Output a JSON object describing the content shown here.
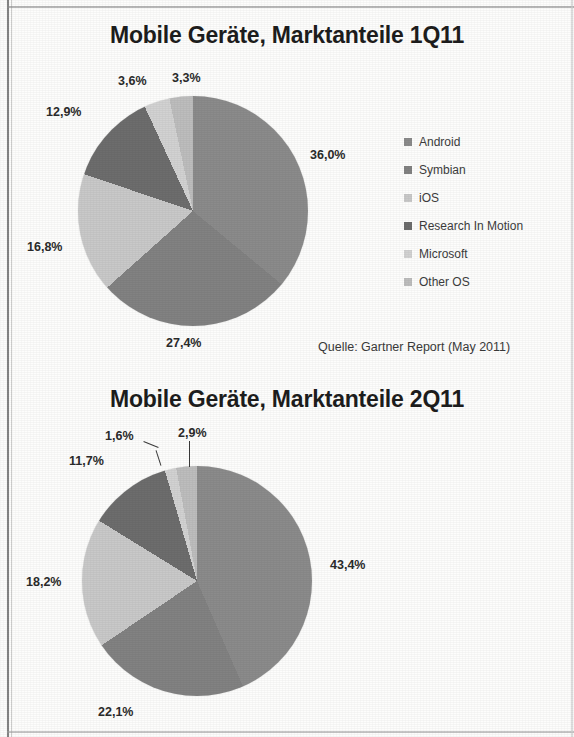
{
  "document": {
    "kind": "scanned-slide",
    "background_color": "#fdfdfc"
  },
  "palette": {
    "android": "#8b8b8b",
    "symbian": "#828282",
    "ios": "#c9c9c9",
    "rim": "#6d6d6d",
    "microsoft": "#d2d2d2",
    "other_os": "#bdbdbd",
    "text": "#1d1d1d",
    "label": "#2b2b2b"
  },
  "charts": [
    {
      "id": "chart-1q11",
      "title": "Mobile Geräte, Marktanteile 1Q11",
      "source": "Quelle: Gartner Report (May 2011)",
      "legend": [
        {
          "label": "Android",
          "color": "#8b8b8b"
        },
        {
          "label": "Symbian",
          "color": "#828282"
        },
        {
          "label": "iOS",
          "color": "#c9c9c9"
        },
        {
          "label": "Research In Motion",
          "color": "#6d6d6d"
        },
        {
          "label": "Microsoft",
          "color": "#d2d2d2"
        },
        {
          "label": "Other OS",
          "color": "#bdbdbd"
        }
      ],
      "labels": {
        "android": "36,0%",
        "symbian": "27,4%",
        "ios": "16,8%",
        "rim": "12,9%",
        "microsoft": "3,6%",
        "other_os": "3,3%"
      }
    },
    {
      "id": "chart-2q11",
      "title": "Mobile Geräte, Marktanteile 2Q11",
      "source": "Quelle: Gartner Report (August 2011)",
      "legend": [
        {
          "label": "Android",
          "color": "#8b8b8b"
        },
        {
          "label": "Symbian",
          "color": "#828282"
        },
        {
          "label": "iOS",
          "color": "#c9c9c9"
        },
        {
          "label": "Research In Motion",
          "color": "#6d6d6d"
        },
        {
          "label": "Microsoft",
          "color": "#d2d2d2"
        },
        {
          "label": "Other OS",
          "color": "#bdbdbd"
        }
      ],
      "labels": {
        "android": "43,4%",
        "symbian": "22,1%",
        "ios": "18,2%",
        "rim": "11,7%",
        "microsoft": "1,6%",
        "other_os": "2,9%"
      }
    }
  ],
  "chart_data": [
    {
      "type": "pie",
      "title": "Mobile Geräte, Marktanteile 1Q11",
      "subtitle": "Quelle: Gartner Report (May 2011)",
      "categories": [
        "Android",
        "Symbian",
        "iOS",
        "Research In Motion",
        "Microsoft",
        "Other OS"
      ],
      "values": [
        36.0,
        27.4,
        16.8,
        12.9,
        3.6,
        3.3
      ],
      "value_labels": [
        "36,0%",
        "27,4%",
        "16,8%",
        "12,9%",
        "3,6%",
        "3,3%"
      ],
      "colors": [
        "#8b8b8b",
        "#828282",
        "#c9c9c9",
        "#6d6d6d",
        "#d2d2d2",
        "#bdbdbd"
      ],
      "unit": "percent",
      "start_angle_deg": 0,
      "direction": "clockwise",
      "legend": "right",
      "grid": false
    },
    {
      "type": "pie",
      "title": "Mobile Geräte, Marktanteile 2Q11",
      "subtitle": "Quelle: Gartner Report (August 2011)",
      "categories": [
        "Android",
        "Symbian",
        "iOS",
        "Research In Motion",
        "Microsoft",
        "Other OS"
      ],
      "values": [
        43.4,
        22.1,
        18.2,
        11.7,
        1.6,
        2.9
      ],
      "value_labels": [
        "43,4%",
        "22,1%",
        "18,2%",
        "11,7%",
        "1,6%",
        "2,9%"
      ],
      "colors": [
        "#8b8b8b",
        "#828282",
        "#c9c9c9",
        "#6d6d6d",
        "#d2d2d2",
        "#bdbdbd"
      ],
      "unit": "percent",
      "start_angle_deg": 0,
      "direction": "clockwise",
      "legend": "right",
      "grid": false
    }
  ]
}
